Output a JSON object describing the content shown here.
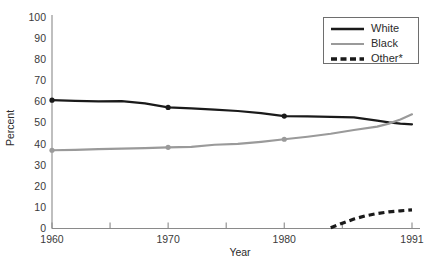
{
  "chart_data": {
    "type": "line",
    "title": "",
    "xlabel": "Year",
    "ylabel": "Percent",
    "xlim": [
      1960,
      1991
    ],
    "ylim": [
      0,
      100
    ],
    "grid": false,
    "legend_position": "top-right",
    "x_ticks": [
      1960,
      1965,
      1970,
      1975,
      1980,
      1985,
      1991
    ],
    "x_tick_labels": [
      "1960",
      "",
      "1970",
      "",
      "1980",
      "",
      "1991"
    ],
    "y_ticks": [
      0,
      10,
      20,
      30,
      40,
      50,
      60,
      70,
      80,
      90,
      100
    ],
    "y_tick_labels": [
      "0",
      "10",
      "20",
      "30",
      "40",
      "50",
      "60",
      "70",
      "80",
      "90",
      "100"
    ],
    "series": [
      {
        "name": "White",
        "color": "#1a1a1a",
        "style": "solid",
        "markers": [
          1960,
          1970,
          1980
        ],
        "x": [
          1960,
          1962,
          1964,
          1966,
          1968,
          1970,
          1972,
          1974,
          1976,
          1978,
          1980,
          1982,
          1984,
          1986,
          1988,
          1989,
          1990,
          1991
        ],
        "values": [
          60.7,
          60.4,
          60.2,
          60.3,
          59.2,
          57.3,
          56.8,
          56.2,
          55.6,
          54.6,
          53.2,
          53.0,
          52.8,
          52.6,
          51.0,
          50.2,
          49.6,
          49.3
        ]
      },
      {
        "name": "Black",
        "color": "#9a9a9a",
        "style": "solid",
        "markers": [
          1960,
          1970,
          1980
        ],
        "x": [
          1960,
          1962,
          1964,
          1966,
          1968,
          1970,
          1972,
          1974,
          1976,
          1978,
          1980,
          1982,
          1984,
          1986,
          1988,
          1989,
          1990,
          1991
        ],
        "values": [
          37.0,
          37.2,
          37.5,
          37.8,
          38.0,
          38.4,
          38.6,
          39.6,
          40.0,
          41.0,
          42.2,
          43.4,
          44.8,
          46.6,
          48.2,
          49.6,
          51.6,
          54.0
        ]
      },
      {
        "name": "Other*",
        "color": "#1a1a1a",
        "style": "dashed",
        "markers": [],
        "x": [
          1984,
          1985,
          1986,
          1987,
          1988,
          1989,
          1990,
          1991
        ],
        "values": [
          0.3,
          2.4,
          4.4,
          5.9,
          7.0,
          7.8,
          8.3,
          8.7
        ]
      }
    ]
  },
  "legend": {
    "items": [
      {
        "label": "White",
        "color": "#1a1a1a",
        "style": "solid"
      },
      {
        "label": "Black",
        "color": "#9a9a9a",
        "style": "solid"
      },
      {
        "label": "Other*",
        "color": "#1a1a1a",
        "style": "dashed"
      }
    ]
  },
  "axes": {
    "x_title": "Year",
    "y_title": "Percent"
  },
  "colors": {
    "white_series": "#1a1a1a",
    "black_series": "#9a9a9a",
    "other_series": "#1a1a1a",
    "axis": "#8a8a8a",
    "text": "#2b2b2b",
    "background": "#ffffff"
  }
}
